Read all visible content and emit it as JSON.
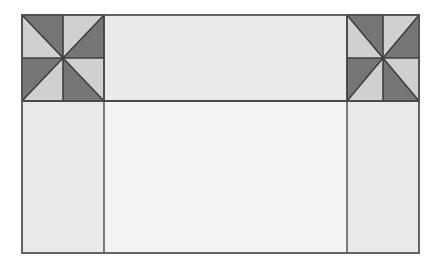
{
  "document": {
    "title": "Pinwheel Corner Quilt Block Layout",
    "kind": "quilt-block-diagram",
    "canvas_width": 448,
    "canvas_height": 277
  },
  "palette": {
    "background": "#ffffff",
    "patch_dark": "#767676",
    "patch_light": "#d0d0d0",
    "sashing_light": "#eaeaea",
    "column_light": "#e9e9e9",
    "center_panel": "#f3f3f3",
    "seam_line": "#3f3f3f",
    "outline": "#555555"
  },
  "layout": {
    "content_rect": {
      "x": 22,
      "y": 15,
      "width": 397,
      "height": 238
    },
    "divider_horizontal_y": 101,
    "divider_vertical_left_x": 104,
    "divider_vertical_right_x": 347,
    "rows": [
      {
        "name": "top-row",
        "y": 15,
        "height": 86
      },
      {
        "name": "bottom-row",
        "y": 101,
        "height": 152
      }
    ],
    "columns": [
      {
        "name": "left-column",
        "x": 22,
        "width": 82
      },
      {
        "name": "center-column",
        "x": 104,
        "width": 243
      },
      {
        "name": "right-column",
        "x": 347,
        "width": 72
      }
    ]
  },
  "regions": [
    {
      "id": "pinwheel-top-left",
      "label": "Pinwheel Block (Top Left)",
      "type": "pinwheel",
      "x": 22,
      "y": 15,
      "width": 82,
      "height": 86,
      "units": [
        {
          "quadrant": "top-left",
          "diagonal": "tl-br",
          "dark_side": "upper-right",
          "light_side": "lower-left"
        },
        {
          "quadrant": "top-right",
          "diagonal": "tr-bl",
          "dark_side": "lower-right",
          "light_side": "upper-left"
        },
        {
          "quadrant": "bottom-left",
          "diagonal": "tr-bl",
          "dark_side": "upper-left",
          "light_side": "lower-right"
        },
        {
          "quadrant": "bottom-right",
          "diagonal": "tl-br",
          "dark_side": "lower-left",
          "light_side": "upper-right"
        }
      ]
    },
    {
      "id": "pinwheel-top-right",
      "label": "Pinwheel Block (Top Right)",
      "type": "pinwheel",
      "x": 347,
      "y": 15,
      "width": 72,
      "height": 86,
      "units": [
        {
          "quadrant": "top-left",
          "diagonal": "tl-br",
          "dark_side": "upper-right",
          "light_side": "lower-left"
        },
        {
          "quadrant": "top-right",
          "diagonal": "tr-bl",
          "dark_side": "lower-right",
          "light_side": "upper-left"
        },
        {
          "quadrant": "bottom-left",
          "diagonal": "tr-bl",
          "dark_side": "upper-left",
          "light_side": "lower-right"
        },
        {
          "quadrant": "bottom-right",
          "diagonal": "tl-br",
          "dark_side": "lower-left",
          "light_side": "upper-right"
        }
      ]
    },
    {
      "id": "sashing-top-center",
      "label": "Top Sashing Bar",
      "type": "plain-patch",
      "x": 104,
      "y": 15,
      "width": 243,
      "height": 86,
      "fill": "#eaeaea"
    },
    {
      "id": "column-bottom-left",
      "label": "Left Border Column",
      "type": "plain-patch",
      "x": 22,
      "y": 101,
      "width": 82,
      "height": 152,
      "fill": "#e9e9e9"
    },
    {
      "id": "panel-bottom-center",
      "label": "Center Panel",
      "type": "plain-patch",
      "x": 104,
      "y": 101,
      "width": 243,
      "height": 152,
      "fill": "#f3f3f3"
    },
    {
      "id": "column-bottom-right",
      "label": "Right Border Column",
      "type": "plain-patch",
      "x": 347,
      "y": 101,
      "width": 72,
      "height": 152,
      "fill": "#e9e9e9"
    }
  ]
}
